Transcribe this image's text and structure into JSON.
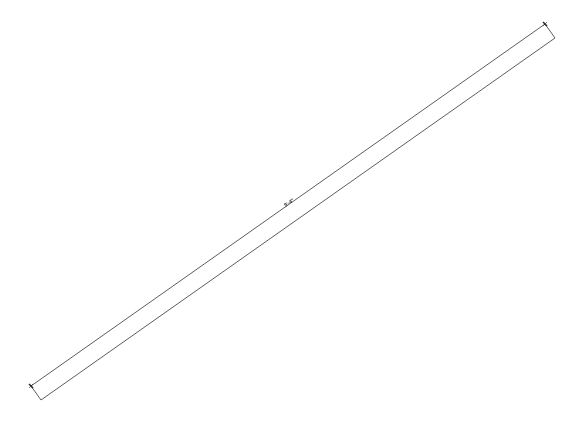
{
  "drawing": {
    "dimension_label": "9'-4\"",
    "line_color": "#333333",
    "background": "#ffffff",
    "dimension_line": {
      "x1": 31,
      "y1": 386,
      "x2": 545,
      "y2": 24
    },
    "outer_line": {
      "x1": 41,
      "y1": 400,
      "x2": 555,
      "y2": 38
    },
    "label_position": {
      "x": 290,
      "y": 206,
      "angle": -35.2
    }
  }
}
